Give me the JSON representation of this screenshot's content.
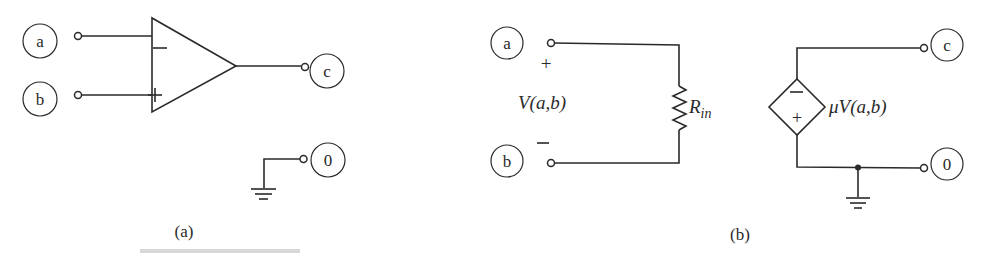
{
  "figure": {
    "panel_a": {
      "caption": "(a)",
      "nodes": {
        "a": "a",
        "b": "b",
        "c": "c",
        "ground": "0"
      },
      "opamp": {
        "inverting_sign": "−",
        "noninverting_sign": "+"
      }
    },
    "panel_b": {
      "caption": "(b)",
      "nodes": {
        "a": "a",
        "b": "b",
        "c": "c",
        "ground": "0"
      },
      "input_plus": "+",
      "input_minus": "−",
      "input_voltage": "V(a,b)",
      "resistor_label": {
        "main": "R",
        "sub": "in"
      },
      "source": {
        "top_sign": "−",
        "bottom_sign": "+",
        "label": "μV(a,b)"
      }
    }
  },
  "colors": {
    "ink": "#2a2a2a",
    "background": "#ffffff"
  }
}
